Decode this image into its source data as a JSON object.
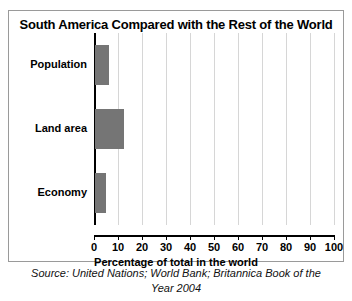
{
  "chart_data": {
    "type": "bar",
    "orientation": "horizontal",
    "title": "South America Compared with the Rest of the World",
    "categories": [
      "Population",
      "Land area",
      "Economy"
    ],
    "values": [
      6,
      12,
      4.5
    ],
    "xlabel": "Percentage of total in the world",
    "ylabel": "",
    "xlim": [
      0,
      100
    ],
    "xticks": [
      0,
      10,
      20,
      30,
      40,
      50,
      60,
      70,
      80,
      90,
      100
    ],
    "xticklabels": [
      "0",
      "10",
      "20",
      "30",
      "40",
      "50",
      "60",
      "70",
      "80",
      "90",
      "100"
    ],
    "grid": "vertical",
    "legend": "none",
    "bar_color": "#757575",
    "gridline_color": "#d6d6d6",
    "axis_color": "#000000"
  },
  "caption": {
    "source_line_1": "Source: United Nations; World Bank; Britannica Book of the",
    "source_line_2": "Year 2004"
  }
}
